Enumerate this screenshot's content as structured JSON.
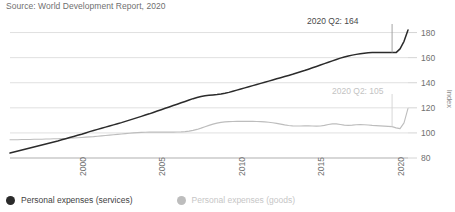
{
  "source_note": "Source: World Development Report, 2020",
  "legend": {
    "position": "bottom-left",
    "items": [
      {
        "label": "Personal expenses (services)",
        "color": "#2b2b2b",
        "key": "services"
      },
      {
        "label": "Personal expenses (goods)",
        "color": "#bdbdbd",
        "key": "goods"
      }
    ]
  },
  "annotations": [
    {
      "text": "2020 Q2: 164",
      "series": "services",
      "color": "#4a4a4a"
    },
    {
      "text": "2020 Q2: 105",
      "series": "goods",
      "color": "#c3c3c3"
    }
  ],
  "chart_data": {
    "type": "line",
    "title": "",
    "subtitle": "",
    "xlabel": "",
    "ylabel": "Index",
    "ylim": [
      80,
      190
    ],
    "yticks": [
      80,
      100,
      120,
      140,
      160,
      180
    ],
    "xlim": [
      1996.0,
      2021.0
    ],
    "xticks": [
      2000,
      2005,
      2010,
      2015,
      2020
    ],
    "xtick_labels": [
      "2000",
      "2005",
      "2010",
      "2015",
      "2020"
    ],
    "grid": "horizontal",
    "legend_position": "bottom-left",
    "colors": {
      "services": "#2b2b2b",
      "goods": "#bdbdbd"
    },
    "x": [
      1996.0,
      1996.25,
      1996.5,
      1996.75,
      1997.0,
      1997.25,
      1997.5,
      1997.75,
      1998.0,
      1998.25,
      1998.5,
      1998.75,
      1999.0,
      1999.25,
      1999.5,
      1999.75,
      2000.0,
      2000.25,
      2000.5,
      2000.75,
      2001.0,
      2001.25,
      2001.5,
      2001.75,
      2002.0,
      2002.25,
      2002.5,
      2002.75,
      2003.0,
      2003.25,
      2003.5,
      2003.75,
      2004.0,
      2004.25,
      2004.5,
      2004.75,
      2005.0,
      2005.25,
      2005.5,
      2005.75,
      2006.0,
      2006.25,
      2006.5,
      2006.75,
      2007.0,
      2007.25,
      2007.5,
      2007.75,
      2008.0,
      2008.25,
      2008.5,
      2008.75,
      2009.0,
      2009.25,
      2009.5,
      2009.75,
      2010.0,
      2010.25,
      2010.5,
      2010.75,
      2011.0,
      2011.25,
      2011.5,
      2011.75,
      2012.0,
      2012.25,
      2012.5,
      2012.75,
      2013.0,
      2013.25,
      2013.5,
      2013.75,
      2014.0,
      2014.25,
      2014.5,
      2014.75,
      2015.0,
      2015.25,
      2015.5,
      2015.75,
      2016.0,
      2016.25,
      2016.5,
      2016.75,
      2017.0,
      2017.25,
      2017.5,
      2017.75,
      2018.0,
      2018.25,
      2018.5,
      2018.75,
      2019.0,
      2019.25,
      2019.5,
      2019.75,
      2020.0,
      2020.25,
      2020.5,
      2020.75,
      2021.0
    ],
    "series": [
      {
        "name": "Personal expenses (services)",
        "key": "services",
        "color": "#2b2b2b",
        "values": [
          84.0,
          84.8,
          85.6,
          86.4,
          87.2,
          88.0,
          88.8,
          89.6,
          90.4,
          91.2,
          92.0,
          92.8,
          93.6,
          94.5,
          95.4,
          96.3,
          97.2,
          98.1,
          99.0,
          100.0,
          101.0,
          101.9,
          102.8,
          103.7,
          104.6,
          105.5,
          106.4,
          107.3,
          108.2,
          109.2,
          110.2,
          111.2,
          112.2,
          113.2,
          114.2,
          115.2,
          116.3,
          117.4,
          118.5,
          119.6,
          120.7,
          121.8,
          122.9,
          124.0,
          125.1,
          126.2,
          127.3,
          128.2,
          129.0,
          129.6,
          130.0,
          130.3,
          130.6,
          131.0,
          131.6,
          132.3,
          133.2,
          134.1,
          135.0,
          135.9,
          136.8,
          137.7,
          138.6,
          139.5,
          140.4,
          141.3,
          142.2,
          143.1,
          144.0,
          144.9,
          145.8,
          146.7,
          147.7,
          148.7,
          149.7,
          150.8,
          151.9,
          153.0,
          154.1,
          155.2,
          156.3,
          157.4,
          158.5,
          159.6,
          160.5,
          161.3,
          162.0,
          162.6,
          163.1,
          163.5,
          163.8,
          164.0,
          164.0,
          164.0,
          164.0,
          164.0,
          164.0,
          164.0,
          167.0,
          173.0,
          182.0
        ],
        "annotation_value": 164
      },
      {
        "name": "Personal expenses (goods)",
        "key": "goods",
        "color": "#bdbdbd",
        "values": [
          94.5,
          94.6,
          94.6,
          94.7,
          94.7,
          94.8,
          94.9,
          95.0,
          95.0,
          95.1,
          95.2,
          95.3,
          95.4,
          95.5,
          95.6,
          95.8,
          96.0,
          96.2,
          96.4,
          96.6,
          96.8,
          97.0,
          97.3,
          97.6,
          97.9,
          98.2,
          98.5,
          98.8,
          99.1,
          99.4,
          99.7,
          100.0,
          100.2,
          100.4,
          100.5,
          100.6,
          100.6,
          100.6,
          100.6,
          100.6,
          100.6,
          100.6,
          100.7,
          100.8,
          101.0,
          101.4,
          102.0,
          102.8,
          103.8,
          104.9,
          106.0,
          107.0,
          107.8,
          108.4,
          108.8,
          109.0,
          109.1,
          109.2,
          109.2,
          109.2,
          109.2,
          109.2,
          109.1,
          109.0,
          108.8,
          108.5,
          108.1,
          107.6,
          107.0,
          106.4,
          105.9,
          105.6,
          105.5,
          105.5,
          105.6,
          105.6,
          105.5,
          105.4,
          105.5,
          106.0,
          106.7,
          107.2,
          107.2,
          106.7,
          106.2,
          106.0,
          106.2,
          106.5,
          106.6,
          106.5,
          106.3,
          106.0,
          105.8,
          105.6,
          105.4,
          105.2,
          105.0,
          104.0,
          103.4,
          108.0,
          119.5
        ],
        "annotation_value": 105
      }
    ]
  }
}
